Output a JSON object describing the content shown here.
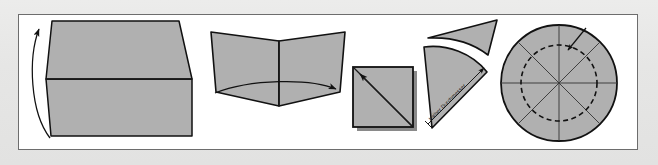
{
  "figure": {
    "background_color": "#e6e6e5",
    "frame_color": "#6d6d6d",
    "paper_fill": "#b0b0b0",
    "paper_stroke": "#1a1a1a",
    "shadow_color": "#808080",
    "panel_count": 5
  },
  "panels": [
    {
      "id": "panel-1",
      "name": "fold-sheet-in-half",
      "step": 1,
      "shape": "rectangular sheet folded along horizontal centre line",
      "arrow": "curved-up-arrow",
      "arrow_direction": "up",
      "label": ""
    },
    {
      "id": "panel-2",
      "name": "fold-half-into-quarter",
      "step": 2,
      "shape": "open book / V-shaped folded sheet",
      "arrow": "curved-right-arrow",
      "arrow_direction": "right",
      "label": ""
    },
    {
      "id": "panel-3",
      "name": "folded-square-with-diagonals",
      "step": 3,
      "shape": "square with both diagonals drawn",
      "arrow": "straight-up-left-arrow",
      "arrow_direction": "up-left",
      "label": ""
    },
    {
      "id": "panel-4",
      "name": "quarter-cone-with-radius",
      "step": 4,
      "shape": "quarter circle cone with cut-off tip lifting away",
      "arrow": "curved-lift-arrow",
      "arrow_direction": "up-right",
      "label": "halber Durchmesser"
    },
    {
      "id": "panel-5",
      "name": "unfolded-circle-with-fold-lines",
      "step": 5,
      "shape": "circle with eight radial fold lines and dashed inner circle",
      "arrow": "short-pointer-arrow",
      "arrow_direction": "down-left",
      "label": ""
    }
  ],
  "annotations": {
    "dimension_label": "halber Durchmesser",
    "dimension_label_rotation_deg": 45
  }
}
